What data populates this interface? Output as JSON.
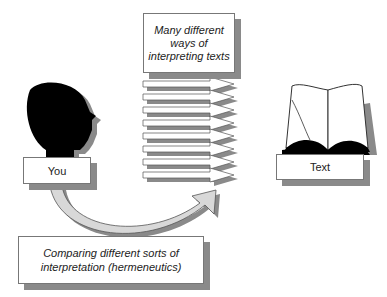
{
  "diagram": {
    "top_label": {
      "lines": [
        "Many different",
        "ways of",
        "interpreting texts"
      ]
    },
    "you_label": "You",
    "text_label": "Text",
    "bottom_label": {
      "lines": [
        "Comparing different sorts of",
        "interpretation (hermeneutics)"
      ]
    },
    "arrow_count": 8,
    "icons": {
      "head": "head-silhouette-icon",
      "book": "open-book-icon",
      "arrows": "right-arrow-icon",
      "curve": "curved-arrow-icon"
    },
    "colors": {
      "shadow": "#8a8a8a",
      "silhouette": "#000000",
      "border": "#777777",
      "curve_fill": "#d0d0d0"
    }
  }
}
